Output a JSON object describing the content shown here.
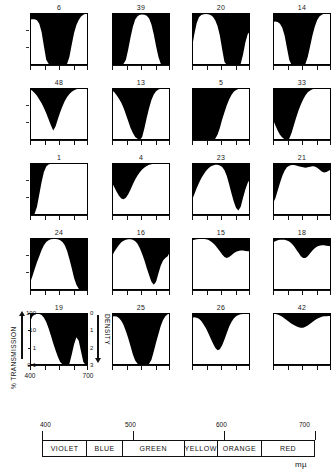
{
  "figure": {
    "unit_label": "mµ",
    "y_axis": {
      "left_title": "% TRANSMISSION",
      "right_title": "DENSITY",
      "left_ticks": [
        "100",
        "10",
        "1",
        "0·1"
      ],
      "right_ticks": [
        "0",
        "1",
        "2",
        "3"
      ]
    },
    "x_axis": {
      "ticks": [
        "400",
        "700"
      ],
      "tick_positions_nm": [
        400,
        700
      ]
    },
    "spectrum": {
      "scale_labels": [
        "400",
        "500",
        "600",
        "700"
      ],
      "scale_positions_nm": [
        400,
        500,
        600,
        700
      ],
      "bands": [
        {
          "name": "VIOLET",
          "start_nm": 400,
          "end_nm": 450
        },
        {
          "name": "BLUE",
          "start_nm": 450,
          "end_nm": 490
        },
        {
          "name": "GREEN",
          "start_nm": 490,
          "end_nm": 560
        },
        {
          "name": "YELLOW",
          "start_nm": 560,
          "end_nm": 590
        },
        {
          "name": "ORANGE",
          "start_nm": 590,
          "end_nm": 640
        },
        {
          "name": "RED",
          "start_nm": 640,
          "end_nm": 700
        }
      ]
    }
  },
  "chart_data": {
    "type": "area",
    "title": "",
    "xlabel": "mµ",
    "ylabel": "% TRANSMISSION",
    "xlim": [
      400,
      700
    ],
    "ylim": [
      0.1,
      100
    ],
    "yscale": "log",
    "grid": false,
    "legend": "none",
    "note": "Grid of 20 spectral transmission curves; black fill = absorbed (opaque) region above the transmission curve, white = transmitted.",
    "panels": [
      {
        "id": "6",
        "row": 1,
        "col": 1,
        "x": [
          400,
          412,
          424,
          436,
          448,
          460,
          472,
          484,
          496,
          508,
          520,
          532,
          544,
          556,
          568,
          580,
          592,
          604,
          616,
          628,
          640,
          652,
          664,
          676,
          688,
          700
        ],
        "values": [
          42,
          44,
          43,
          38,
          24,
          8,
          1.2,
          0.2,
          0.12,
          0.1,
          0.1,
          0.1,
          0.1,
          0.1,
          0.1,
          0.1,
          0.12,
          0.3,
          1.5,
          7,
          20,
          40,
          62,
          80,
          93,
          100
        ]
      },
      {
        "id": "39",
        "row": 1,
        "col": 2,
        "x": [
          400,
          412,
          424,
          436,
          448,
          460,
          472,
          484,
          496,
          508,
          520,
          532,
          544,
          556,
          568,
          580,
          592,
          604,
          616,
          628,
          640,
          652,
          664,
          676,
          688,
          700
        ],
        "values": [
          0.1,
          0.1,
          0.1,
          0.1,
          0.1,
          0.12,
          0.2,
          0.8,
          4,
          16,
          42,
          66,
          78,
          82,
          80,
          70,
          48,
          22,
          6,
          1.2,
          0.3,
          0.12,
          0.1,
          0.1,
          0.1,
          0.1
        ]
      },
      {
        "id": "20",
        "row": 1,
        "col": 3,
        "x": [
          400,
          412,
          424,
          436,
          448,
          460,
          472,
          484,
          496,
          508,
          520,
          532,
          544,
          556,
          568,
          580,
          592,
          604,
          616,
          628,
          640,
          652,
          664,
          676,
          688,
          700
        ],
        "values": [
          1,
          6,
          26,
          56,
          76,
          86,
          88,
          85,
          76,
          60,
          38,
          18,
          5,
          0.8,
          0.15,
          0.1,
          0.1,
          0.1,
          0.1,
          0.1,
          0.1,
          0.12,
          0.4,
          2,
          6,
          9
        ]
      },
      {
        "id": "14",
        "row": 1,
        "col": 4,
        "x": [
          400,
          412,
          424,
          436,
          448,
          460,
          472,
          484,
          496,
          508,
          520,
          532,
          544,
          556,
          568,
          580,
          592,
          604,
          616,
          628,
          640,
          652,
          664,
          676,
          688,
          700
        ],
        "values": [
          30,
          32,
          30,
          24,
          14,
          5,
          1,
          0.2,
          0.1,
          0.1,
          0.1,
          0.1,
          0.1,
          0.1,
          0.12,
          0.3,
          1.2,
          5,
          16,
          38,
          62,
          80,
          92,
          97,
          99,
          100
        ]
      },
      {
        "id": "48",
        "row": 2,
        "col": 1,
        "x": [
          400,
          412,
          424,
          436,
          448,
          460,
          472,
          484,
          496,
          508,
          520,
          532,
          544,
          556,
          568,
          580,
          592,
          604,
          616,
          628,
          640,
          652,
          664,
          676,
          688,
          700
        ],
        "values": [
          84,
          70,
          52,
          36,
          22,
          13,
          7,
          3.5,
          1.6,
          0.7,
          0.35,
          0.6,
          1.6,
          4,
          9,
          18,
          30,
          45,
          60,
          74,
          85,
          92,
          96,
          98,
          99,
          100
        ]
      },
      {
        "id": "13",
        "row": 2,
        "col": 2,
        "x": [
          400,
          412,
          424,
          436,
          448,
          460,
          472,
          484,
          496,
          508,
          520,
          532,
          544,
          556,
          568,
          580,
          592,
          604,
          616,
          628,
          640,
          652,
          664,
          676,
          688,
          700
        ],
        "values": [
          74,
          56,
          38,
          24,
          14,
          7,
          3,
          1.2,
          0.5,
          0.25,
          0.15,
          0.12,
          0.1,
          0.15,
          0.5,
          2,
          7,
          20,
          42,
          65,
          82,
          92,
          96,
          98,
          99,
          100
        ]
      },
      {
        "id": "5",
        "row": 2,
        "col": 1,
        "x": [
          400,
          412,
          424,
          436,
          448,
          460,
          472,
          484,
          496,
          508,
          520,
          532,
          544,
          556,
          568,
          580,
          592,
          604,
          616,
          628,
          640,
          652,
          664,
          676,
          688,
          700
        ],
        "values": [
          0.1,
          0.1,
          0.1,
          0.1,
          0.1,
          0.1,
          0.1,
          0.1,
          0.1,
          0.1,
          0.12,
          0.2,
          0.5,
          1.5,
          4,
          10,
          22,
          40,
          60,
          76,
          87,
          93,
          97,
          99,
          100,
          100
        ]
      },
      {
        "id": "33",
        "row": 2,
        "col": 4,
        "x": [
          400,
          412,
          424,
          436,
          448,
          460,
          472,
          484,
          496,
          508,
          520,
          532,
          544,
          556,
          568,
          580,
          592,
          604,
          616,
          628,
          640,
          652,
          664,
          676,
          688,
          700
        ],
        "values": [
          1.5,
          0.7,
          0.35,
          0.2,
          0.14,
          0.11,
          0.1,
          0.12,
          0.25,
          0.7,
          2,
          5,
          11,
          22,
          38,
          56,
          72,
          84,
          92,
          96,
          98,
          99,
          100,
          100,
          100,
          100
        ]
      },
      {
        "id": "1",
        "row": 3,
        "col": 1,
        "x": [
          400,
          412,
          424,
          436,
          448,
          460,
          472,
          484,
          496,
          508,
          520,
          532,
          544,
          556,
          568,
          580,
          592,
          604,
          616,
          628,
          640,
          652,
          664,
          676,
          688,
          700
        ],
        "values": [
          0.1,
          0.1,
          0.12,
          0.3,
          1.5,
          8,
          30,
          62,
          82,
          92,
          96,
          98,
          99,
          100,
          100,
          100,
          100,
          100,
          100,
          100,
          100,
          100,
          100,
          100,
          100,
          100
        ]
      },
      {
        "id": "4",
        "row": 3,
        "col": 2,
        "x": [
          400,
          412,
          424,
          436,
          448,
          460,
          472,
          484,
          496,
          508,
          520,
          532,
          544,
          556,
          568,
          580,
          592,
          604,
          616,
          628,
          640,
          652,
          664,
          676,
          688,
          700
        ],
        "values": [
          7,
          4,
          2.2,
          1.3,
          0.9,
          0.8,
          1,
          1.6,
          3,
          6,
          11,
          19,
          29,
          42,
          55,
          68,
          78,
          86,
          91,
          95,
          97,
          98,
          99,
          100,
          100,
          100
        ]
      },
      {
        "id": "23",
        "row": 3,
        "col": 3,
        "x": [
          400,
          412,
          424,
          436,
          448,
          460,
          472,
          484,
          496,
          508,
          520,
          532,
          544,
          556,
          568,
          580,
          592,
          604,
          616,
          628,
          640,
          652,
          664,
          676,
          688,
          700
        ],
        "values": [
          0.7,
          1.6,
          3.5,
          7,
          13,
          22,
          34,
          48,
          62,
          72,
          78,
          78,
          72,
          58,
          38,
          18,
          6,
          1.8,
          0.6,
          0.25,
          0.18,
          0.3,
          1,
          3,
          7,
          12
        ]
      },
      {
        "id": "21",
        "row": 3,
        "col": 4,
        "x": [
          400,
          412,
          424,
          436,
          448,
          460,
          472,
          484,
          496,
          508,
          520,
          532,
          544,
          556,
          568,
          580,
          592,
          604,
          616,
          628,
          640,
          652,
          664,
          676,
          688,
          700
        ],
        "values": [
          0.5,
          0.9,
          2.5,
          7,
          18,
          36,
          56,
          70,
          76,
          76,
          72,
          66,
          60,
          56,
          54,
          56,
          60,
          64,
          62,
          54,
          42,
          32,
          28,
          30,
          36,
          42
        ]
      },
      {
        "id": "24",
        "row": 4,
        "col": 1,
        "x": [
          400,
          412,
          424,
          436,
          448,
          460,
          472,
          484,
          496,
          508,
          520,
          532,
          544,
          556,
          568,
          580,
          592,
          604,
          616,
          628,
          640,
          652,
          664,
          676,
          688,
          700
        ],
        "values": [
          0.25,
          0.6,
          1.6,
          4,
          9,
          20,
          38,
          58,
          74,
          84,
          88,
          88,
          84,
          74,
          58,
          38,
          18,
          6,
          1.8,
          0.5,
          0.2,
          0.12,
          0.1,
          0.1,
          0.1,
          0.1
        ]
      },
      {
        "id": "16",
        "row": 4,
        "col": 2,
        "x": [
          400,
          412,
          424,
          436,
          448,
          460,
          472,
          484,
          496,
          508,
          520,
          532,
          544,
          556,
          568,
          580,
          592,
          604,
          616,
          628,
          640,
          652,
          664,
          676,
          688,
          700
        ],
        "values": [
          9,
          16,
          26,
          40,
          56,
          70,
          80,
          86,
          86,
          80,
          66,
          46,
          26,
          12,
          5,
          1.8,
          0.7,
          0.3,
          0.2,
          0.3,
          0.9,
          2.5,
          5,
          7,
          9,
          16
        ]
      },
      {
        "id": "15",
        "row": 4,
        "col": 3,
        "x": [
          400,
          412,
          424,
          436,
          448,
          460,
          472,
          484,
          496,
          508,
          520,
          532,
          544,
          556,
          568,
          580,
          592,
          604,
          616,
          628,
          640,
          652,
          664,
          676,
          688,
          700
        ],
        "values": [
          72,
          78,
          84,
          88,
          90,
          90,
          86,
          78,
          66,
          52,
          38,
          26,
          17,
          11,
          8,
          7,
          8,
          10,
          13,
          16,
          18,
          19,
          19,
          18,
          17,
          17
        ]
      },
      {
        "id": "18",
        "row": 4,
        "col": 4,
        "x": [
          400,
          412,
          424,
          436,
          448,
          460,
          472,
          484,
          496,
          508,
          520,
          532,
          544,
          556,
          568,
          580,
          592,
          604,
          616,
          628,
          640,
          652,
          664,
          676,
          688,
          700
        ],
        "values": [
          56,
          66,
          74,
          78,
          80,
          78,
          72,
          62,
          48,
          34,
          22,
          14,
          9,
          7,
          7,
          9,
          13,
          19,
          26,
          32,
          36,
          38,
          38,
          36,
          34,
          33
        ]
      },
      {
        "id": "19",
        "row": 5,
        "col": 1,
        "x": [
          400,
          412,
          424,
          436,
          448,
          460,
          472,
          484,
          496,
          508,
          520,
          532,
          544,
          556,
          568,
          580,
          592,
          604,
          616,
          628,
          640,
          652,
          664,
          676,
          688,
          700
        ],
        "values": [
          30,
          62,
          82,
          90,
          88,
          76,
          54,
          30,
          13,
          5,
          1.8,
          0.7,
          0.3,
          0.15,
          0.11,
          0.1,
          0.1,
          0.12,
          0.4,
          1.6,
          4,
          2.5,
          0.6,
          0.15,
          0.1,
          0.1
        ]
      },
      {
        "id": "25",
        "row": 5,
        "col": 2,
        "x": [
          400,
          412,
          424,
          436,
          448,
          460,
          472,
          484,
          496,
          508,
          520,
          532,
          544,
          556,
          568,
          580,
          592,
          604,
          616,
          628,
          640,
          652,
          664,
          676,
          688,
          700
        ],
        "values": [
          62,
          66,
          62,
          52,
          36,
          20,
          9,
          3.5,
          1.2,
          0.4,
          0.18,
          0.12,
          0.1,
          0.1,
          0.1,
          0.1,
          0.12,
          0.2,
          0.6,
          2,
          6,
          18,
          40,
          66,
          84,
          92
        ]
      },
      {
        "id": "26",
        "row": 5,
        "col": 3,
        "x": [
          400,
          412,
          424,
          436,
          448,
          460,
          472,
          484,
          496,
          508,
          520,
          532,
          544,
          556,
          568,
          580,
          592,
          604,
          616,
          628,
          640,
          652,
          664,
          676,
          688,
          700
        ],
        "values": [
          52,
          56,
          54,
          46,
          34,
          22,
          13,
          7,
          3.5,
          1.8,
          1,
          0.7,
          0.8,
          1.4,
          3,
          7,
          16,
          30,
          48,
          64,
          76,
          84,
          88,
          90,
          91,
          91
        ]
      },
      {
        "id": "42",
        "row": 5,
        "col": 4,
        "x": [
          400,
          412,
          424,
          436,
          448,
          460,
          472,
          484,
          496,
          508,
          520,
          532,
          544,
          556,
          568,
          580,
          592,
          604,
          616,
          628,
          640,
          652,
          664,
          676,
          688,
          700
        ],
        "values": [
          90,
          88,
          82,
          72,
          60,
          48,
          38,
          30,
          24,
          20,
          17,
          15,
          14,
          14,
          16,
          19,
          24,
          30,
          38,
          46,
          54,
          60,
          64,
          66,
          67,
          67
        ]
      }
    ]
  }
}
